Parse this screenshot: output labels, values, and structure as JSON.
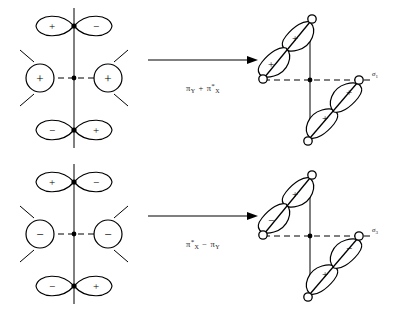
{
  "diagram": {
    "stroke_color": "#000000",
    "fill_color": "#ffffff",
    "schemes": [
      {
        "id": "scheme-top",
        "reactant": {
          "name": "reactant-orbital-top",
          "axis": "vertical-solid-horizontal-dashed",
          "top_lobes": {
            "left": "+",
            "right": "−"
          },
          "bottom_lobes": {
            "left": "−",
            "right": "+"
          },
          "side_circles": {
            "left": "+",
            "right": "+"
          }
        },
        "transform": {
          "name": "pi-y-plus-pi-x-star",
          "term1": "π",
          "term1_sub": "Y",
          "operator": "+",
          "term2": "π",
          "term2_star": "*",
          "term2_sub": "X"
        },
        "product": {
          "name": "product-orbital-top",
          "label": "σ",
          "label_sub": "1",
          "upper_branch": {
            "outer": "+",
            "inner": "+"
          },
          "lower_branch": {
            "inner": "+",
            "outer": "+"
          }
        }
      },
      {
        "id": "scheme-bottom",
        "reactant": {
          "name": "reactant-orbital-bottom",
          "axis": "vertical-solid-horizontal-dashed",
          "top_lobes": {
            "left": "+",
            "right": "−"
          },
          "bottom_lobes": {
            "left": "−",
            "right": "+"
          },
          "side_circles": {
            "left": "−",
            "right": "−"
          }
        },
        "transform": {
          "name": "pi-x-star-minus-pi-y",
          "term1": "π",
          "term1_star": "*",
          "term1_sub": "X",
          "operator": "−",
          "term2": "π",
          "term2_sub": "Y"
        },
        "product": {
          "name": "product-orbital-bottom",
          "label": "σ",
          "label_sub": "3",
          "upper_branch": {
            "outer": "−",
            "inner": "+"
          },
          "lower_branch": {
            "inner": "−",
            "outer": "+"
          }
        }
      }
    ]
  }
}
